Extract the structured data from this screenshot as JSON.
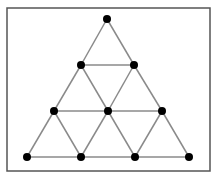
{
  "diagram": {
    "type": "triangular-grid",
    "rows": 4,
    "frame": {
      "x": 7,
      "y": 8,
      "width": 203,
      "height": 163,
      "stroke": "#555555"
    },
    "colors": {
      "edge": "#8a8a8a",
      "node": "#000000",
      "background": "#ffffff"
    },
    "node_radius": 4,
    "nodes": [
      {
        "id": "n1",
        "row": 1,
        "x": 107,
        "y": 19
      },
      {
        "id": "n2",
        "row": 2,
        "x": 81,
        "y": 65
      },
      {
        "id": "n3",
        "row": 2,
        "x": 134,
        "y": 65
      },
      {
        "id": "n4",
        "row": 3,
        "x": 54,
        "y": 111
      },
      {
        "id": "n5",
        "row": 3,
        "x": 108,
        "y": 111
      },
      {
        "id": "n6",
        "row": 3,
        "x": 162,
        "y": 111
      },
      {
        "id": "n7",
        "row": 4,
        "x": 27,
        "y": 157
      },
      {
        "id": "n8",
        "row": 4,
        "x": 81,
        "y": 157
      },
      {
        "id": "n9",
        "row": 4,
        "x": 135,
        "y": 157
      },
      {
        "id": "n10",
        "row": 4,
        "x": 189,
        "y": 157
      }
    ],
    "edges": [
      [
        "n1",
        "n2"
      ],
      [
        "n1",
        "n3"
      ],
      [
        "n2",
        "n3"
      ],
      [
        "n2",
        "n4"
      ],
      [
        "n2",
        "n5"
      ],
      [
        "n3",
        "n5"
      ],
      [
        "n3",
        "n6"
      ],
      [
        "n4",
        "n5"
      ],
      [
        "n5",
        "n6"
      ],
      [
        "n4",
        "n7"
      ],
      [
        "n4",
        "n8"
      ],
      [
        "n5",
        "n8"
      ],
      [
        "n5",
        "n9"
      ],
      [
        "n6",
        "n9"
      ],
      [
        "n6",
        "n10"
      ],
      [
        "n7",
        "n8"
      ],
      [
        "n8",
        "n9"
      ],
      [
        "n9",
        "n10"
      ]
    ]
  }
}
